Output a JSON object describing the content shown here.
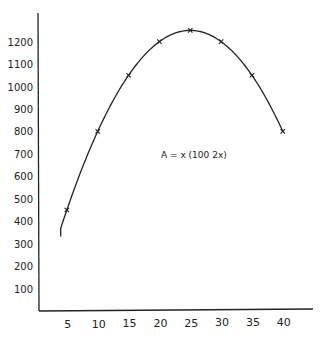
{
  "chart_data": {
    "type": "line",
    "title": "",
    "xlabel": "",
    "ylabel": "",
    "annotation": "A = x (100   2x)",
    "function": "A = x(100 - 2x)",
    "x": [
      5,
      10,
      15,
      20,
      25,
      30,
      35,
      40
    ],
    "series": [
      {
        "name": "A",
        "values": [
          450,
          800,
          1050,
          1200,
          1250,
          1200,
          1050,
          800
        ],
        "marker": "x"
      }
    ],
    "curve_x_range": [
      4,
      40
    ],
    "xlim": [
      0,
      45
    ],
    "ylim": [
      0,
      1300
    ],
    "x_ticks": [
      5,
      10,
      15,
      20,
      25,
      30,
      35,
      40
    ],
    "x_tick_labels": [
      "5",
      "10",
      "15",
      "20",
      "25",
      "30",
      "35",
      "40"
    ],
    "y_ticks": [
      100,
      200,
      300,
      400,
      500,
      600,
      700,
      800,
      900,
      1000,
      1100,
      1200
    ],
    "y_tick_labels": [
      "100",
      "200",
      "300",
      "400",
      "500",
      "600",
      "700",
      "800",
      "900",
      "1000",
      "1100",
      "1200"
    ],
    "grid": false,
    "legend": "none",
    "colors": {
      "ink": "#222222",
      "background": "#ffffff"
    }
  }
}
